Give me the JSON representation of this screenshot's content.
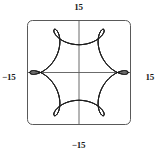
{
  "figure": {
    "background_color": "#ffffff",
    "frame_color": "#4d4d4d",
    "curve_color": "#1a1a1a",
    "axis_color": "#555555",
    "label_color": "#1a1a1a"
  },
  "axis_labels": {
    "top": "15",
    "bottom": "−15",
    "left": "−15",
    "right": "15"
  },
  "chart_data": {
    "type": "line",
    "title": "",
    "xlabel": "",
    "ylabel": "",
    "xlim": [
      -15,
      15
    ],
    "ylim": [
      -15,
      15
    ],
    "xticks": [
      -15,
      15
    ],
    "yticks": [
      -15,
      15
    ],
    "xticklabels": [
      "−15",
      "15"
    ],
    "yticklabels": [
      "−15",
      "15"
    ],
    "grid": false,
    "legend": false,
    "axes_through_origin": true,
    "frame": "rounded-rectangle",
    "series": [
      {
        "name": "epitrochoid",
        "parametric": true,
        "description": "Closed parametric curve with 8 inner loops and a scalloped outer envelope, inscribed in a square spanning -15 to 15 on both axes",
        "equation_x": "11*cos(t) + 4*cos(11*t/4)",
        "equation_y": "11*sin(t) - 4*sin(11*t/4)",
        "t_range": [
          0,
          25.132741228718345
        ],
        "loop_count": 8,
        "outer_radius": 14.5,
        "inner_radius": 3.2,
        "color": "#1a1a1a",
        "linewidth": 0.8
      }
    ]
  }
}
